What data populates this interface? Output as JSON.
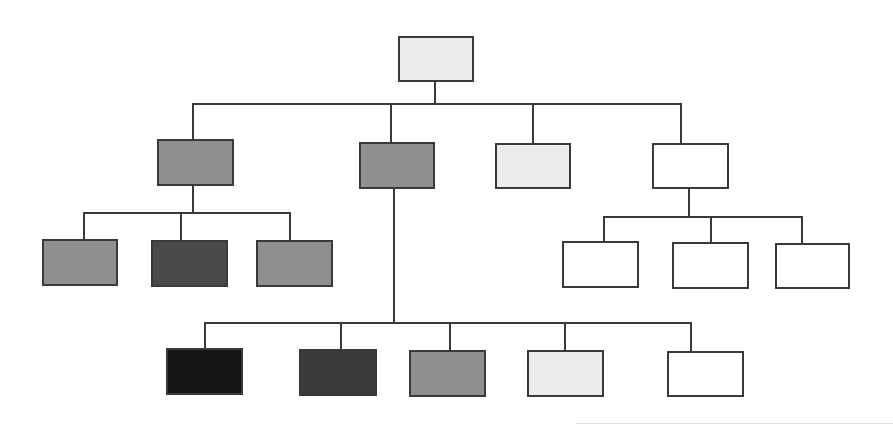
{
  "diagram": {
    "type": "org-chart / hierarchy tree",
    "text_labels": [],
    "fills": {
      "white": "#ffffff",
      "light": "#ebebeb",
      "mid": "#8f8f8f",
      "dark": "#4a4a4a",
      "darker": "#3a3a3a",
      "black": "#151515"
    },
    "nodes": [
      {
        "id": "root",
        "level": 0,
        "fill": "light",
        "x": 398,
        "y": 36,
        "w": 76,
        "h": 46
      },
      {
        "id": "l1-a",
        "level": 1,
        "parent": "root",
        "fill": "mid",
        "x": 157,
        "y": 139,
        "w": 77,
        "h": 47
      },
      {
        "id": "l1-b",
        "level": 1,
        "parent": "root",
        "fill": "mid",
        "x": 359,
        "y": 142,
        "w": 76,
        "h": 47
      },
      {
        "id": "l1-c",
        "level": 1,
        "parent": "root",
        "fill": "light",
        "x": 495,
        "y": 143,
        "w": 76,
        "h": 46
      },
      {
        "id": "l1-d",
        "level": 1,
        "parent": "root",
        "fill": "white",
        "x": 652,
        "y": 143,
        "w": 77,
        "h": 46
      },
      {
        "id": "l2-a1",
        "level": 2,
        "parent": "l1-a",
        "fill": "mid",
        "x": 42,
        "y": 239,
        "w": 76,
        "h": 47
      },
      {
        "id": "l2-a2",
        "level": 2,
        "parent": "l1-a",
        "fill": "dark",
        "x": 151,
        "y": 240,
        "w": 77,
        "h": 47
      },
      {
        "id": "l2-a3",
        "level": 2,
        "parent": "l1-a",
        "fill": "mid",
        "x": 256,
        "y": 240,
        "w": 77,
        "h": 47
      },
      {
        "id": "l2-d1",
        "level": 2,
        "parent": "l1-d",
        "fill": "white",
        "x": 562,
        "y": 241,
        "w": 77,
        "h": 47
      },
      {
        "id": "l2-d2",
        "level": 2,
        "parent": "l1-d",
        "fill": "white",
        "x": 672,
        "y": 242,
        "w": 77,
        "h": 47
      },
      {
        "id": "l2-d3",
        "level": 2,
        "parent": "l1-d",
        "fill": "white",
        "x": 775,
        "y": 243,
        "w": 75,
        "h": 46
      },
      {
        "id": "l2-b1",
        "level": 2,
        "parent": "l1-b",
        "fill": "black",
        "x": 166,
        "y": 348,
        "w": 77,
        "h": 47
      },
      {
        "id": "l2-b2",
        "level": 2,
        "parent": "l1-b",
        "fill": "darker",
        "x": 299,
        "y": 349,
        "w": 78,
        "h": 47
      },
      {
        "id": "l2-b3",
        "level": 2,
        "parent": "l1-b",
        "fill": "mid",
        "x": 409,
        "y": 350,
        "w": 77,
        "h": 47
      },
      {
        "id": "l2-b4",
        "level": 2,
        "parent": "l1-b",
        "fill": "light",
        "x": 527,
        "y": 350,
        "w": 77,
        "h": 47
      },
      {
        "id": "l2-b5",
        "level": 2,
        "parent": "l1-b",
        "fill": "white",
        "x": 667,
        "y": 351,
        "w": 77,
        "h": 46
      }
    ],
    "connectors": [
      {
        "id": "root-down",
        "orient": "v",
        "x": 434,
        "y": 81,
        "len": 23
      },
      {
        "id": "root-bus",
        "orient": "h",
        "x": 192,
        "y": 103,
        "len": 489
      },
      {
        "id": "to-l1-a",
        "orient": "v",
        "x": 192,
        "y": 103,
        "len": 37
      },
      {
        "id": "to-l1-b",
        "orient": "v",
        "x": 390,
        "y": 103,
        "len": 40
      },
      {
        "id": "to-l1-c",
        "orient": "v",
        "x": 532,
        "y": 103,
        "len": 41
      },
      {
        "id": "to-l1-d",
        "orient": "v",
        "x": 680,
        "y": 103,
        "len": 41
      },
      {
        "id": "l1-a-down",
        "orient": "v",
        "x": 192,
        "y": 185,
        "len": 28
      },
      {
        "id": "l1-a-bus",
        "orient": "h",
        "x": 83,
        "y": 212,
        "len": 208
      },
      {
        "id": "to-l2-a1",
        "orient": "v",
        "x": 83,
        "y": 212,
        "len": 28
      },
      {
        "id": "to-l2-a2",
        "orient": "v",
        "x": 180,
        "y": 212,
        "len": 29
      },
      {
        "id": "to-l2-a3",
        "orient": "v",
        "x": 289,
        "y": 212,
        "len": 29
      },
      {
        "id": "l1-d-down",
        "orient": "v",
        "x": 688,
        "y": 188,
        "len": 29
      },
      {
        "id": "l1-d-bus",
        "orient": "h",
        "x": 603,
        "y": 216,
        "len": 200
      },
      {
        "id": "to-l2-d1",
        "orient": "v",
        "x": 603,
        "y": 216,
        "len": 26
      },
      {
        "id": "to-l2-d2",
        "orient": "v",
        "x": 710,
        "y": 216,
        "len": 27
      },
      {
        "id": "to-l2-d3",
        "orient": "v",
        "x": 801,
        "y": 216,
        "len": 28
      },
      {
        "id": "l1-b-down",
        "orient": "v",
        "x": 393,
        "y": 188,
        "len": 136
      },
      {
        "id": "l1-b-bus",
        "orient": "h",
        "x": 204,
        "y": 322,
        "len": 487
      },
      {
        "id": "to-l2-b1",
        "orient": "v",
        "x": 204,
        "y": 322,
        "len": 27
      },
      {
        "id": "to-l2-b2",
        "orient": "v",
        "x": 340,
        "y": 322,
        "len": 28
      },
      {
        "id": "to-l2-b3",
        "orient": "v",
        "x": 449,
        "y": 322,
        "len": 29
      },
      {
        "id": "to-l2-b4",
        "orient": "v",
        "x": 564,
        "y": 322,
        "len": 29
      },
      {
        "id": "to-l2-b5",
        "orient": "v",
        "x": 690,
        "y": 322,
        "len": 30
      }
    ],
    "decor": [
      {
        "id": "scan-edge",
        "x": 575,
        "y": 423,
        "w": 318
      }
    ]
  }
}
